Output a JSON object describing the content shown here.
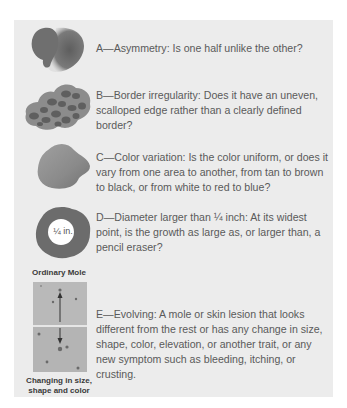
{
  "criteria": [
    {
      "letter": "A",
      "text": "A—Asymmetry: Is one half unlike the other?",
      "icon": "asymmetric-mole-icon"
    },
    {
      "letter": "B",
      "text": "B—Border irregularity: Does it have an uneven, scalloped edge rather than a clearly defined border?",
      "icon": "irregular-border-mole-icon"
    },
    {
      "letter": "C",
      "text": "C—Color variation: Is the color uniform, or does it vary from one area to another, from tan to brown to black, or from white to red to blue?",
      "icon": "color-variation-mole-icon"
    },
    {
      "letter": "D",
      "text": "D—Diameter larger than ¼ inch: At its widest point, is the growth as large as, or larger than, a pencil eraser?",
      "icon": "diameter-mole-icon",
      "badge": "¼ in."
    },
    {
      "letter": "E",
      "text": "E—Evolving: A mole or skin lesion that looks different from the rest or has any change in size, shape, color, elevation, or another trait, or any new symptom such as bleeding, itching, or crusting.",
      "icon": "evolving-mole-photo"
    }
  ],
  "evolving_figure": {
    "top_caption": "Ordinary Mole",
    "bottom_caption": "Changing in size, shape and color"
  },
  "colors": {
    "panel_bg": "#ececec",
    "text": "#5a5a5a",
    "mole_dark": "#6e6e6e",
    "mole_mid": "#8a8a8a"
  }
}
